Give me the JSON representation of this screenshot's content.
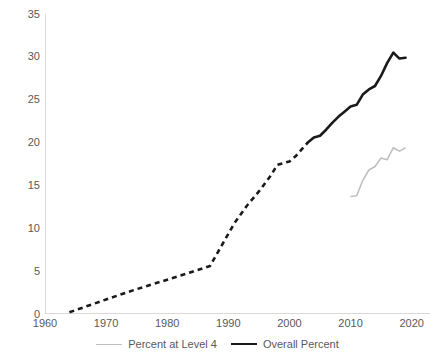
{
  "chart_data": {
    "type": "line",
    "title": "",
    "xlabel": "",
    "ylabel": "",
    "xlim": [
      1960,
      2023
    ],
    "ylim": [
      0,
      35
    ],
    "grid": false,
    "legend_position": "bottom",
    "x_ticks": [
      "1960",
      "1970",
      "1980",
      "1990",
      "2000",
      "2010",
      "2020"
    ],
    "y_ticks": [
      "0",
      "5",
      "10",
      "15",
      "20",
      "25",
      "30",
      "35"
    ],
    "series": [
      {
        "name": "Percent at Level 4",
        "color": "#bfbfbf",
        "style": "solid",
        "width": 1.6,
        "x": [
          2010,
          2011,
          2012,
          2013,
          2014,
          2015,
          2016,
          2017,
          2018,
          2019
        ],
        "values": [
          13.7,
          13.8,
          15.6,
          16.8,
          17.2,
          18.2,
          18.0,
          19.4,
          19.0,
          19.4
        ]
      },
      {
        "name": "Overall Percent",
        "color": "#1a1a1a",
        "style": "dashed-then-solid",
        "width": 2.6,
        "dash_until": 2003,
        "x": [
          1964,
          1970,
          1975,
          1980,
          1984,
          1987,
          1989,
          1991,
          1993,
          1995,
          1997,
          1998,
          1999,
          2000,
          2001,
          2002,
          2003,
          2004,
          2005,
          2006,
          2007,
          2008,
          2009,
          2010,
          2011,
          2012,
          2013,
          2014,
          2015,
          2016,
          2017,
          2018,
          2019
        ],
        "values": [
          0.2,
          1.7,
          2.9,
          4.0,
          4.9,
          5.6,
          8.1,
          10.6,
          12.6,
          14.3,
          16.2,
          17.4,
          17.6,
          17.8,
          18.4,
          19.2,
          20.0,
          20.6,
          20.8,
          21.5,
          22.3,
          23.0,
          23.6,
          24.2,
          24.4,
          25.6,
          26.2,
          26.6,
          27.8,
          29.3,
          30.5,
          29.8,
          29.9
        ]
      }
    ]
  },
  "legend": {
    "items": [
      {
        "label": "Percent at Level 4",
        "swatch": "thin-gray-line"
      },
      {
        "label": "Overall Percent",
        "swatch": "thick-black-line"
      }
    ]
  },
  "colors": {
    "axis": "#d9d9d9",
    "tick_text": "#595959",
    "series_gray": "#bfbfbf",
    "series_black": "#1a1a1a",
    "background": "#ffffff"
  }
}
